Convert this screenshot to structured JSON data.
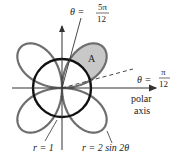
{
  "diagram": {
    "curves": {
      "circle": {
        "equation_label": "r = 1",
        "radius": 1,
        "color": "#111111"
      },
      "rose": {
        "equation_label": "r = 2 sin 2θ",
        "amplitude": 2,
        "color": "#6e6e6e"
      }
    },
    "region": {
      "label": "A",
      "fill": "#c8c8c8"
    },
    "rays": [
      {
        "label_lhs": "θ =",
        "num": "5π",
        "den": "12",
        "angle_deg": 75,
        "style": "solid"
      },
      {
        "label_lhs": "θ =",
        "num": "π",
        "den": "12",
        "angle_deg": 15,
        "style": "dashed"
      }
    ],
    "axis": {
      "label_line1": "polar",
      "label_line2": "axis"
    }
  }
}
